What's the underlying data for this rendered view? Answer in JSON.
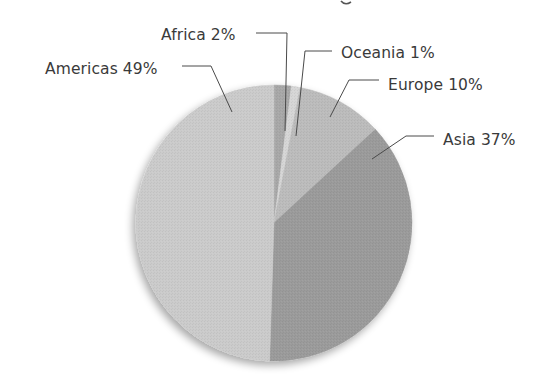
{
  "chart_data": {
    "type": "pie",
    "title": "",
    "title_note": "title text is cropped off the top edge; only a descender is visible",
    "start_angle_deg": 0,
    "direction": "clockwise",
    "legend": "none (direct labels with leader lines)",
    "categories": [
      "Africa",
      "Oceania",
      "Europe",
      "Asia",
      "Americas"
    ],
    "values": [
      2,
      1,
      10,
      37,
      49
    ],
    "unit": "%",
    "labels": [
      "Africa 2%",
      "Oceania 1%",
      "Europe 10%",
      "Asia 37%",
      "Americas 49%"
    ],
    "colors": [
      "#a8a8a8",
      "#d6d6d6",
      "#bcbcbc",
      "#9b9b9b",
      "#cbcbcb"
    ]
  },
  "layout": {
    "center": [
      274,
      223
    ],
    "radius": 138
  },
  "slices": [
    {
      "name": "Africa",
      "label": "Africa 2%",
      "value": 2,
      "color": "#a8a8a8",
      "label_pos": [
        161,
        40
      ],
      "anchor": "start",
      "leader": [
        [
          256,
          33
        ],
        [
          287,
          33
        ],
        [
          285,
          131
        ]
      ]
    },
    {
      "name": "Oceania",
      "label": "Oceania 1%",
      "value": 1,
      "color": "#d6d6d6",
      "label_pos": [
        341,
        58
      ],
      "anchor": "start",
      "leader": [
        [
          332,
          51
        ],
        [
          305,
          51
        ],
        [
          296,
          136
        ]
      ]
    },
    {
      "name": "Europe",
      "label": "Europe 10%",
      "value": 10,
      "color": "#bcbcbc",
      "label_pos": [
        388,
        90
      ],
      "anchor": "start",
      "leader": [
        [
          379,
          80
        ],
        [
          349,
          80
        ],
        [
          330,
          117
        ]
      ]
    },
    {
      "name": "Asia",
      "label": "Asia 37%",
      "value": 37,
      "color": "#9b9b9b",
      "label_pos": [
        443,
        145
      ],
      "anchor": "start",
      "leader": [
        [
          434,
          136
        ],
        [
          406,
          136
        ],
        [
          372,
          159
        ]
      ]
    },
    {
      "name": "Americas",
      "label": "Americas 49%",
      "value": 49,
      "color": "#cbcbcb",
      "label_pos": [
        45,
        74
      ],
      "anchor": "start",
      "leader": [
        [
          182,
          66
        ],
        [
          211,
          66
        ],
        [
          232,
          112
        ]
      ]
    }
  ]
}
